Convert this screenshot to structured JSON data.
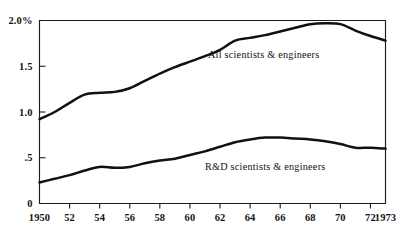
{
  "chart_data": {
    "type": "line",
    "title": "",
    "subtitle": "",
    "xlabel": "",
    "ylabel": "",
    "xlim": [
      1950,
      1973
    ],
    "ylim": [
      0,
      2.0
    ],
    "grid": false,
    "legend_position": "inline-annotation",
    "y_ticks": [
      {
        "value": 2.0,
        "label": "2.0%"
      },
      {
        "value": 1.5,
        "label": "1.5"
      },
      {
        "value": 1.0,
        "label": "1.0"
      },
      {
        "value": 0.5,
        "label": ".5"
      },
      {
        "value": 0.0,
        "label": "0"
      }
    ],
    "x_ticks": [
      {
        "value": 1950,
        "label": "1950"
      },
      {
        "value": 1952,
        "label": "52"
      },
      {
        "value": 1954,
        "label": "54"
      },
      {
        "value": 1956,
        "label": "56"
      },
      {
        "value": 1958,
        "label": "58"
      },
      {
        "value": 1960,
        "label": "60"
      },
      {
        "value": 1962,
        "label": "62"
      },
      {
        "value": 1964,
        "label": "64"
      },
      {
        "value": 1966,
        "label": "66"
      },
      {
        "value": 1968,
        "label": "68"
      },
      {
        "value": 1970,
        "label": "70"
      },
      {
        "value": 1972,
        "label": "72"
      },
      {
        "value": 1973,
        "label": "1973"
      }
    ],
    "x": [
      1950,
      1951,
      1952,
      1953,
      1954,
      1955,
      1956,
      1957,
      1958,
      1959,
      1960,
      1961,
      1962,
      1963,
      1964,
      1965,
      1966,
      1967,
      1968,
      1969,
      1970,
      1971,
      1972,
      1973
    ],
    "series": [
      {
        "name": "All scientists & engineers",
        "label": "All scientists & engineers",
        "color": "#111111",
        "annotation": {
          "text": "All scientists & engineers",
          "x": 1961.2,
          "y": 1.63
        },
        "values": [
          0.92,
          1.0,
          1.1,
          1.19,
          1.21,
          1.22,
          1.26,
          1.34,
          1.42,
          1.49,
          1.55,
          1.61,
          1.68,
          1.78,
          1.81,
          1.84,
          1.88,
          1.92,
          1.96,
          1.97,
          1.96,
          1.89,
          1.83,
          1.78
        ]
      },
      {
        "name": "R&D scientists & engineers",
        "label": "R&D scientists & engineers",
        "color": "#111111",
        "annotation": {
          "text": "R&D scientists & engineers",
          "x": 1961.0,
          "y": 0.405
        },
        "values": [
          0.23,
          0.27,
          0.31,
          0.36,
          0.4,
          0.39,
          0.4,
          0.44,
          0.47,
          0.49,
          0.53,
          0.57,
          0.62,
          0.67,
          0.7,
          0.72,
          0.72,
          0.71,
          0.7,
          0.68,
          0.65,
          0.61,
          0.61,
          0.6
        ]
      }
    ]
  },
  "labels": {
    "y_axis_top": "2.0%",
    "series_upper": "All scientists & engineers",
    "series_lower": "R&D scientists & engineers"
  }
}
